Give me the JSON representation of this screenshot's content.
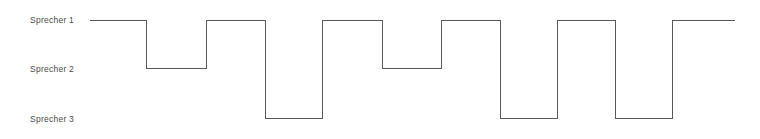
{
  "chart_data": {
    "type": "line",
    "title": "",
    "subtitle": "",
    "xlabel": "",
    "ylabel": "",
    "grid": false,
    "legend": "none",
    "step_style": "post",
    "categories": [
      "Sprecher 1",
      "Sprecher 2",
      "Sprecher 3"
    ],
    "ytick_labels": [
      "Sprecher 1",
      "Sprecher 2",
      "Sprecher 3"
    ],
    "ylim": [
      0,
      3
    ],
    "xlim": [
      0,
      11
    ],
    "annotations": [],
    "series": [
      {
        "name": "Aktiver Sprecher",
        "values": [
          1,
          2,
          1,
          3,
          1,
          2,
          1,
          3,
          1,
          3,
          1
        ],
        "x": [
          0,
          1,
          2,
          3,
          4,
          5,
          6,
          7,
          8,
          9,
          10
        ],
        "segments": [
          {
            "index": 1,
            "speaker": "Sprecher 1",
            "level": 1
          },
          {
            "index": 2,
            "speaker": "Sprecher 2",
            "level": 2
          },
          {
            "index": 3,
            "speaker": "Sprecher 1",
            "level": 1
          },
          {
            "index": 4,
            "speaker": "Sprecher 3",
            "level": 3
          },
          {
            "index": 5,
            "speaker": "Sprecher 1",
            "level": 1
          },
          {
            "index": 6,
            "speaker": "Sprecher 2",
            "level": 2
          },
          {
            "index": 7,
            "speaker": "Sprecher 1",
            "level": 1
          },
          {
            "index": 8,
            "speaker": "Sprecher 3",
            "level": 3
          },
          {
            "index": 9,
            "speaker": "Sprecher 1",
            "level": 1
          },
          {
            "index": 10,
            "speaker": "Sprecher 3",
            "level": 3
          },
          {
            "index": 11,
            "speaker": "Sprecher 1",
            "level": 1
          }
        ]
      }
    ],
    "colors": {
      "line": "#585858",
      "background": "#ffffff",
      "label_text": "#4a4a4a"
    },
    "line_width": 1,
    "path": "M 90 20 L 146 20 L 146 68 L 206 68 L 206 20 L 265 20 L 265 118 L 322 118 L 322 20 L 382 20 L 382 68 L 441 68 L 441 20 L 500 20 L 500 118 L 557 118 L 557 20 L 615 20 L 615 118 L 672 118 L 672 20 L 735 20"
  },
  "labels": {
    "speaker_1": "Sprecher 1",
    "speaker_2": "Sprecher 2",
    "speaker_3": "Sprecher 3"
  }
}
